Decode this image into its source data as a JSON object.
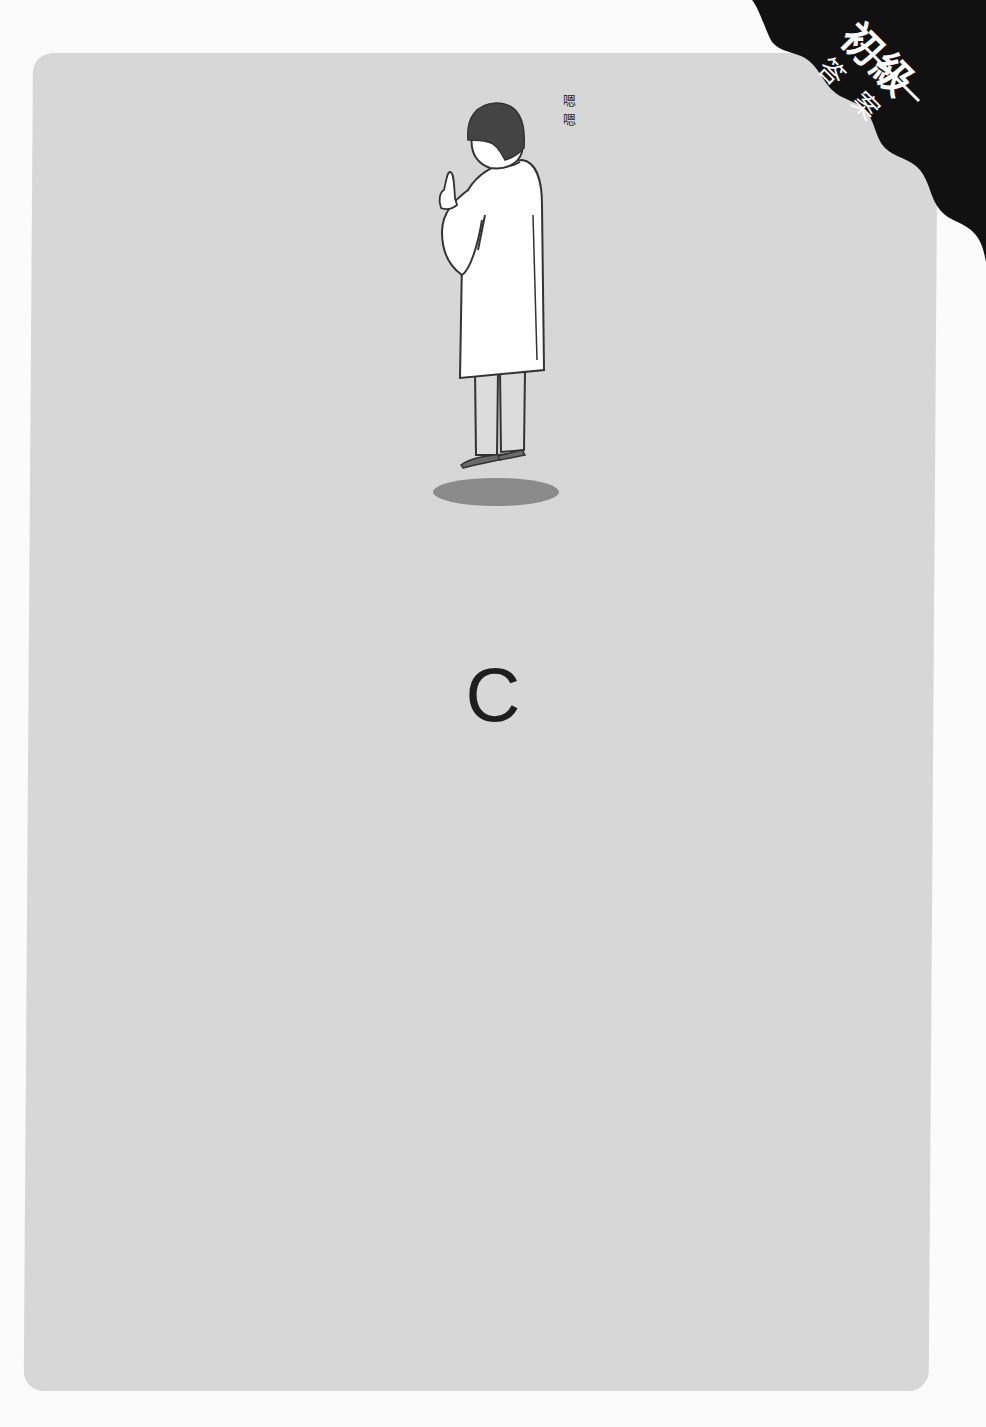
{
  "corner_badge": {
    "level": "初級",
    "label": "答案",
    "background_color": "#111111",
    "text_color": "#ffffff"
  },
  "illustration": {
    "subject": "person-in-white-coat-thinking",
    "thought_text": "嗯嗯",
    "shadow_color": "#8a8a8a",
    "coat_color": "#ffffff",
    "hair_color": "#444444"
  },
  "answer": {
    "letter": "C"
  },
  "colors": {
    "page_background": "#fbfbfb",
    "card_background": "#d7d7d7",
    "text": "#1e1e1e"
  }
}
